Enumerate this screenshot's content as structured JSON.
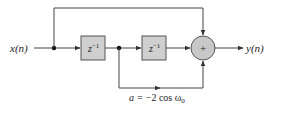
{
  "diagram": {
    "type": "signal-flow block diagram",
    "input_label": "x(n)",
    "output_label": "y(n)",
    "delay_blocks": [
      {
        "label": "z",
        "exponent": "−1"
      },
      {
        "label": "z",
        "exponent": "−1"
      }
    ],
    "adder_symbol": "+",
    "coefficient_label": {
      "prefix": "a = ",
      "expr": "−2 cos ω",
      "subscript": "0"
    },
    "colors": {
      "line": "#444444",
      "block_fill": "#cfcfcf",
      "block_stroke": "#555555",
      "adder_fill": "#c8c8c8",
      "text": "#222222"
    }
  }
}
